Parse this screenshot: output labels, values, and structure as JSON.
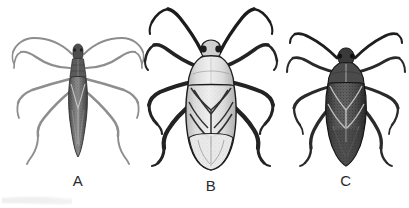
{
  "plate": {
    "background_color": "#ffffff",
    "ink_color": "#1d1d1d",
    "style": "black-and-white line-and-stipple engraving",
    "view": "dorsal",
    "figure_count": 3
  },
  "figures": [
    {
      "label": "A",
      "name": "narrow-elongate-bug",
      "body_tone": "dark-stippled",
      "leg_tone": "pale-gray-slender",
      "antenna_tone": "pale-gray-slender",
      "body_width_ratio": "narrow",
      "outline_color": "#3a3a3a",
      "body_fill": "#6b6b6b",
      "leg_color": "#8e8e8e"
    },
    {
      "label": "B",
      "name": "broad-pale-bug",
      "body_tone": "pale-with-dark-venation",
      "leg_tone": "thick-dark",
      "antenna_tone": "thick-dark",
      "body_width_ratio": "broad",
      "outline_color": "#1d1d1d",
      "body_fill": "#e2e2e2",
      "leg_color": "#232323"
    },
    {
      "label": "C",
      "name": "oval-dark-bug",
      "body_tone": "dark-with-light-veins",
      "leg_tone": "dark-slender",
      "antenna_tone": "dark-slender",
      "body_width_ratio": "medium-oval",
      "outline_color": "#1d1d1d",
      "body_fill": "#4a4a4a",
      "leg_color": "#2a2a2a"
    }
  ],
  "captions": {
    "a": "A",
    "b": "B",
    "c": "C"
  }
}
